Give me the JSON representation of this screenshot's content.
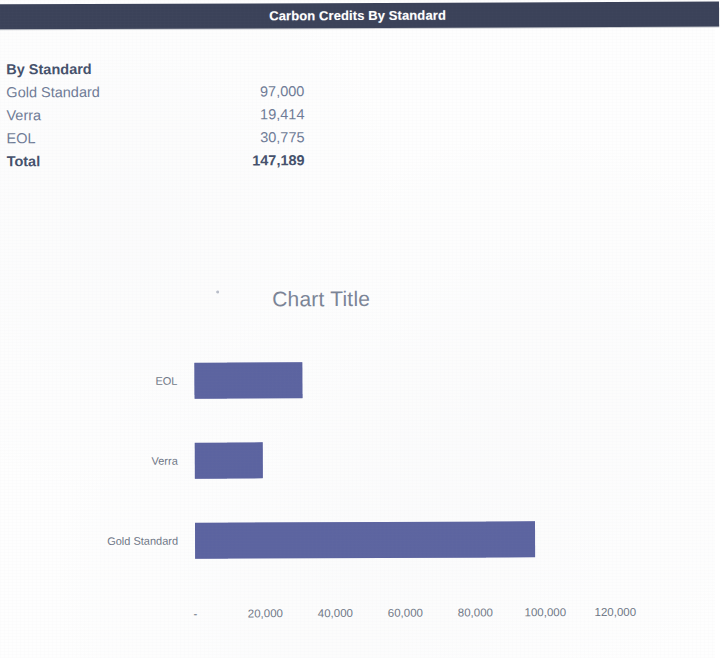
{
  "banner": {
    "title": "Carbon Credits By Standard",
    "background_color": "#3b4259",
    "text_color": "#ffffff"
  },
  "summary_table": {
    "header_label": "By Standard",
    "rows": [
      {
        "label": "Gold Standard",
        "value": "97,000"
      },
      {
        "label": "Verra",
        "value": "19,414"
      },
      {
        "label": "EOL",
        "value": "30,775"
      }
    ],
    "total": {
      "label": "Total",
      "value": "147,189"
    }
  },
  "chart_data": {
    "type": "bar",
    "orientation": "horizontal",
    "title": "Chart Title",
    "categories": [
      "Gold Standard",
      "Verra",
      "EOL"
    ],
    "values": [
      97000,
      19414,
      30775
    ],
    "series": [
      {
        "name": "By Standard",
        "values": [
          97000,
          19414,
          30775
        ]
      }
    ],
    "xlabel": "",
    "ylabel": "",
    "xlim": [
      0,
      120000
    ],
    "xticks": [
      0,
      20000,
      40000,
      60000,
      80000,
      100000,
      120000
    ],
    "xticklabels": [
      "-",
      "20,000",
      "40,000",
      "60,000",
      "80,000",
      "100,000",
      "120,000"
    ],
    "grid": false,
    "legend": false,
    "bar_color": "#5b63a0"
  }
}
